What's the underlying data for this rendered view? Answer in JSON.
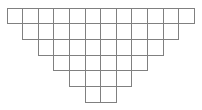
{
  "figure": {
    "type": "cell-grid-diagram",
    "shape": "inverted-stepped-pyramid",
    "background_color": "#ffffff",
    "line_color": "#808080",
    "line_width": 1,
    "cell_fill": "#ffffff",
    "row_count": 6,
    "column_count_top": 12,
    "total_cells": 42,
    "cell_width": 15.6,
    "cell_height": 15.7,
    "origin_x": 7,
    "origin_y": 8
  },
  "chart_data": {
    "type": "table",
    "categories": [
      "Row 1",
      "Row 2",
      "Row 3",
      "Row 4",
      "Row 5",
      "Row 6"
    ],
    "values": [
      12,
      10,
      8,
      6,
      4,
      2
    ],
    "xlabel": "",
    "ylabel": "Cells per row",
    "grid": true,
    "legend": "none"
  },
  "rows": [
    {
      "index": 1,
      "cells": 12,
      "indent": 0,
      "label": "Row 1"
    },
    {
      "index": 2,
      "cells": 10,
      "indent": 1,
      "label": "Row 2"
    },
    {
      "index": 3,
      "cells": 8,
      "indent": 2,
      "label": "Row 3"
    },
    {
      "index": 4,
      "cells": 6,
      "indent": 3,
      "label": "Row 4"
    },
    {
      "index": 5,
      "cells": 4,
      "indent": 4,
      "label": "Row 5"
    },
    {
      "index": 6,
      "cells": 2,
      "indent": 5,
      "label": "Row 6"
    }
  ]
}
